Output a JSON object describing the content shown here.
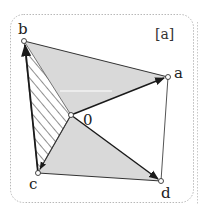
{
  "figure": {
    "panel_label": "[a]",
    "colors": {
      "shade": "#d9d9d9",
      "stroke": "#1a1a1a",
      "thin_stroke": "#555555",
      "frame": "#b8b8b8",
      "hatch": "#222222",
      "point_fill": "#ffffff"
    },
    "points": {
      "b": {
        "label": "b",
        "x": 24,
        "y": 41
      },
      "a": {
        "label": "a",
        "x": 168,
        "y": 77
      },
      "o": {
        "label": "0",
        "x": 71,
        "y": 115
      },
      "c": {
        "label": "c",
        "x": 38,
        "y": 173
      },
      "d": {
        "label": "d",
        "x": 161,
        "y": 181
      }
    },
    "regions": [
      {
        "name": "shaded-triangle-b-a-0",
        "vertices": [
          "b",
          "a",
          "o"
        ],
        "fill": "shade"
      },
      {
        "name": "shaded-triangle-0-c-d",
        "vertices": [
          "o",
          "c",
          "d"
        ],
        "fill": "shade"
      },
      {
        "name": "hatched-triangle-b-0-c",
        "vertices": [
          "b",
          "o",
          "c"
        ],
        "fill": "hatch"
      }
    ],
    "vectors": [
      {
        "from": "o",
        "to": "a"
      },
      {
        "from": "o",
        "to": "d"
      },
      {
        "from": "o",
        "to": "c"
      },
      {
        "from": "c",
        "to": "b"
      }
    ],
    "edges": [
      {
        "from": "b",
        "to": "a"
      },
      {
        "from": "a",
        "to": "d"
      },
      {
        "from": "c",
        "to": "d"
      }
    ]
  }
}
